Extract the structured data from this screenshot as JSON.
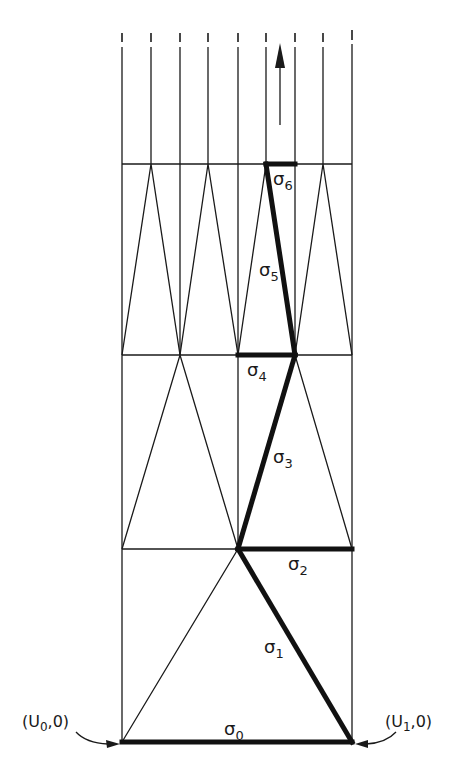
{
  "figure": {
    "labels": {
      "sigma0": {
        "base": "σ",
        "sub": "0"
      },
      "sigma1": {
        "base": "σ",
        "sub": "1"
      },
      "sigma2": {
        "base": "σ",
        "sub": "2"
      },
      "sigma3": {
        "base": "σ",
        "sub": "3"
      },
      "sigma4": {
        "base": "σ",
        "sub": "4"
      },
      "sigma5": {
        "base": "σ",
        "sub": "5"
      },
      "sigma6": {
        "base": "σ",
        "sub": "6"
      }
    },
    "points": {
      "left": {
        "open": "(U",
        "sub": "0",
        "close": ",0)"
      },
      "right": {
        "open": "(U",
        "sub": "1",
        "close": ",0)"
      }
    },
    "direction_arrow": "up",
    "colors": {
      "ink": "#1a1a1a",
      "background": "#ffffff"
    }
  }
}
